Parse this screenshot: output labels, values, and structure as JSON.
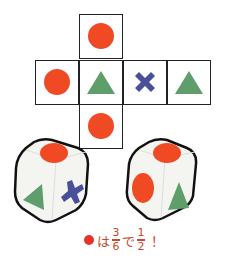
{
  "net": {
    "faces": [
      {
        "id": "top",
        "shape": "circle",
        "color": "#f04a24"
      },
      {
        "id": "left",
        "shape": "circle",
        "color": "#f04a24"
      },
      {
        "id": "front",
        "shape": "triangle",
        "color": "#5e9e6a"
      },
      {
        "id": "right",
        "shape": "cross",
        "color": "#4a4f9a"
      },
      {
        "id": "back",
        "shape": "triangle",
        "color": "#5e9e6a"
      },
      {
        "id": "bottom",
        "shape": "circle",
        "color": "#f04a24"
      }
    ]
  },
  "dice": [
    {
      "id": "die-left",
      "visible_faces": [
        "circle",
        "triangle",
        "cross"
      ]
    },
    {
      "id": "die-right",
      "visible_faces": [
        "circle",
        "circle",
        "triangle"
      ]
    }
  ],
  "caption": {
    "prefix": "は",
    "frac1_num": "3",
    "frac1_den": "6",
    "middle": "で",
    "frac2_num": "1",
    "frac2_den": "2",
    "suffix": "！"
  }
}
